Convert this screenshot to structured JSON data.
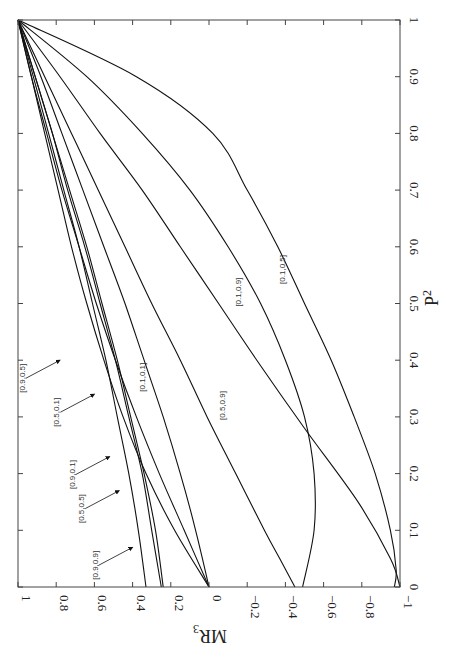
{
  "chart_data": {
    "type": "line",
    "title": "",
    "orientation_note": "figure rotated 90 degrees clockwise on page",
    "xlabel": "P^2",
    "ylabel": "MR_3",
    "xlabel_display": "P",
    "xlabel_sup": "2",
    "ylabel_display": "MR",
    "ylabel_sub": "3",
    "xlim": [
      0,
      1
    ],
    "ylim": [
      -1,
      1
    ],
    "xticks": [
      "0",
      "0.1",
      "0.2",
      "0.3",
      "0.4",
      "0.5",
      "0.6",
      "0.7",
      "0.8",
      "0.9",
      "1"
    ],
    "yticks": [
      "1",
      "0.8",
      "0.6",
      "0.4",
      "0.2",
      "0",
      "−0.2",
      "−0.4",
      "−0.6",
      "−0.8",
      "−1"
    ],
    "grid": false,
    "legend": "inline labels",
    "series": [
      {
        "name": "[0.1,0.5]",
        "x": [
          0,
          0.03,
          0.1,
          0.2,
          0.3,
          0.4,
          0.5,
          0.6,
          0.7,
          0.8,
          0.9,
          1
        ],
        "y": [
          -0.97,
          -0.98,
          -0.95,
          -0.87,
          -0.76,
          -0.64,
          -0.5,
          -0.36,
          -0.2,
          -0.02,
          0.38,
          1
        ]
      },
      {
        "name": "[0.1,0.9]",
        "x": [
          0,
          0.05,
          0.15,
          0.28,
          0.4,
          0.5,
          0.6,
          0.7,
          0.8,
          0.9,
          1
        ],
        "y": [
          -1,
          -0.95,
          -0.78,
          -0.5,
          -0.25,
          -0.05,
          0.15,
          0.35,
          0.57,
          0.78,
          1
        ]
      },
      {
        "name": "[0.5,0.9]",
        "x": [
          0,
          0.05,
          0.1,
          0.2,
          0.3,
          0.4,
          0.5,
          0.6,
          0.7,
          0.8,
          0.9,
          1
        ],
        "y": [
          -0.45,
          -0.37,
          -0.29,
          -0.14,
          0.01,
          0.15,
          0.3,
          0.44,
          0.58,
          0.72,
          0.86,
          1
        ]
      },
      {
        "name": "[0.5,0.1]",
        "x": [
          0,
          0.1,
          0.2,
          0.3,
          0.4,
          0.5,
          0.6,
          0.7,
          0.8,
          0.9,
          1
        ],
        "y": [
          -0.49,
          -0.55,
          -0.55,
          -0.5,
          -0.4,
          -0.27,
          -0.1,
          0.1,
          0.35,
          0.64,
          1
        ]
      },
      {
        "name": "[0.1,0.1]",
        "x": [
          0,
          0.1,
          0.2,
          0.3,
          0.4,
          0.5,
          0.6,
          0.7,
          0.8,
          0.9,
          1
        ],
        "y": [
          0,
          0.07,
          0.15,
          0.24,
          0.34,
          0.44,
          0.55,
          0.66,
          0.77,
          0.88,
          1
        ]
      },
      {
        "name": "[0.9,0.5]",
        "x": [
          0,
          0.1,
          0.2,
          0.3,
          0.4,
          0.5,
          0.6,
          0.7,
          0.8,
          0.9,
          1
        ],
        "y": [
          0.33,
          0.37,
          0.42,
          0.48,
          0.54,
          0.61,
          0.68,
          0.76,
          0.84,
          0.92,
          1
        ]
      },
      {
        "name": "[0.9,0.1]",
        "x": [
          0,
          0.1,
          0.2,
          0.3,
          0.4,
          0.5,
          0.6,
          0.7,
          0.8,
          0.9,
          1
        ],
        "y": [
          0.25,
          0.3,
          0.35,
          0.42,
          0.49,
          0.57,
          0.65,
          0.74,
          0.82,
          0.91,
          1
        ]
      },
      {
        "name": "[0.5,0.5]",
        "x": [
          0,
          0.1,
          0.2,
          0.3,
          0.4,
          0.5,
          0.6,
          0.7,
          0.8,
          0.9,
          1
        ],
        "y": [
          0,
          0.13,
          0.26,
          0.38,
          0.49,
          0.59,
          0.68,
          0.77,
          0.85,
          0.93,
          1
        ]
      },
      {
        "name": "[0.9,0.9]",
        "x": [
          0,
          0.1,
          0.2,
          0.3,
          0.4,
          0.5,
          0.6,
          0.7,
          0.8,
          0.9,
          1
        ],
        "y": [
          0,
          0.18,
          0.33,
          0.45,
          0.55,
          0.64,
          0.72,
          0.79,
          0.86,
          0.93,
          1
        ]
      },
      {
        "name": "[0.9,0.9]b",
        "x": [
          0,
          0.1,
          0.2,
          0.3,
          0.4,
          0.5,
          0.6,
          0.7,
          0.8,
          0.9,
          1
        ],
        "y": [
          0.24,
          0.28,
          0.34,
          0.41,
          0.48,
          0.56,
          0.64,
          0.73,
          0.82,
          0.91,
          1
        ]
      }
    ],
    "annotations": [
      {
        "text": "[0.1,0.5]",
        "at_x": 0.56,
        "at_y": -0.38,
        "arrow": false
      },
      {
        "text": "[0.1,0.9]",
        "at_x": 0.52,
        "at_y": -0.15,
        "arrow": false
      },
      {
        "text": "[0.5,0.9]",
        "at_x": 0.32,
        "at_y": -0.07,
        "arrow": false
      },
      {
        "text": "[0.1,0.1]",
        "at_x": 0.37,
        "at_y": 0.35,
        "arrow": false
      },
      {
        "text": "[0.9,0.5]",
        "at_x": 0.4,
        "at_y": 0.78,
        "arrow": true
      },
      {
        "text": "[0.5,0.1]",
        "at_x": 0.34,
        "at_y": 0.6,
        "arrow": true
      },
      {
        "text": "[0.9,0.1]",
        "at_x": 0.23,
        "at_y": 0.52,
        "arrow": true
      },
      {
        "text": "[0.5,0.5]",
        "at_x": 0.17,
        "at_y": 0.47,
        "arrow": true
      },
      {
        "text": "[0.9,0.9]",
        "at_x": 0.07,
        "at_y": 0.4,
        "arrow": true
      }
    ]
  },
  "ui": {
    "ylabel_main": "MR",
    "ylabel_sub": "3",
    "xlabel_main": "P",
    "xlabel_sup": "2"
  }
}
